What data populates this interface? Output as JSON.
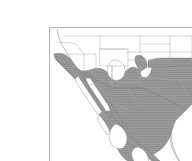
{
  "figure": {
    "type": "range-distribution-map",
    "title": "Distribution range map",
    "region_description": "Southwestern United States and Mexico",
    "caption": "",
    "background_color": "#ffffff",
    "frame": {
      "visible": true,
      "stroke_color": "#b4b4b4",
      "fill_color": "#ffffff",
      "x": 9,
      "y": 11,
      "width": 168,
      "height": 140
    },
    "legend": {
      "visible": false,
      "entries": [
        {
          "label": "Range",
          "swatch_color": "#9a9a9a"
        }
      ]
    },
    "layers": [
      {
        "name": "country-borders",
        "label": "Country and coastline outlines",
        "stroke_color": "#8c8c8c",
        "fill_color": "#ffffff"
      },
      {
        "name": "state-borders",
        "label": "State and province boundaries",
        "stroke_color": "#a8a8a8",
        "fill_color": "none"
      },
      {
        "name": "species-range",
        "label": "Shaded species range",
        "stroke_color": "#7d7d7d",
        "fill_color": "#9a9a9a",
        "hatch_color": "#8f8f8f"
      }
    ],
    "colors": {
      "range_fill": "#9a9a9a",
      "range_outline": "#7d7d7d",
      "land_fill": "#ffffff",
      "border_line": "#a8a8a8",
      "coastline": "#8c8c8c",
      "frame_line": "#b4b4b4",
      "page_background": "#ffffff"
    },
    "annotations": [],
    "labels": []
  }
}
